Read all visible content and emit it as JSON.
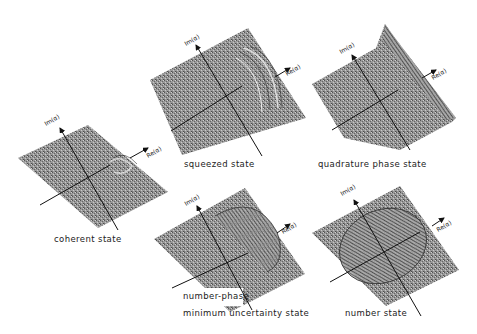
{
  "figure": {
    "axis_labels": {
      "im": "Im(α)",
      "re": "Re(α)"
    },
    "panels": [
      {
        "id": "coherent",
        "caption": "coherent state"
      },
      {
        "id": "squeezed",
        "caption": "squeezed state"
      },
      {
        "id": "quadrature",
        "caption": "quadrature phase state"
      },
      {
        "id": "number-phase",
        "caption_line1": "number-phase",
        "caption_line2": "minimum uncertainty state"
      },
      {
        "id": "number",
        "caption": "number state"
      }
    ]
  },
  "colors": {
    "surface": "#8e8e8e",
    "surface_dark": "#6a6a6a",
    "surface_light": "#b8b8b8",
    "axis": "#111111"
  }
}
